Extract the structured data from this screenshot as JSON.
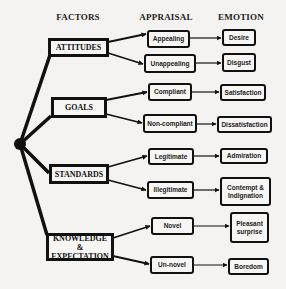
{
  "headers": {
    "factors": "FACTORS",
    "appraisal": "APPRAISAL",
    "emotion": "EMOTION"
  },
  "factors": [
    {
      "label": "ATTITUDES",
      "appraisals": [
        {
          "label": "Appealing",
          "emotion": "Desire"
        },
        {
          "label": "Unappealing",
          "emotion": "Disgust"
        }
      ]
    },
    {
      "label": "GOALS",
      "appraisals": [
        {
          "label": "Compliant",
          "emotion": "Satisfaction"
        },
        {
          "label": "Non-compliant",
          "emotion": "Dissatisfaction"
        }
      ]
    },
    {
      "label": "STANDARDS",
      "appraisals": [
        {
          "label": "Legitimate",
          "emotion": "Admiration"
        },
        {
          "label": "Illegitimate",
          "emotion": "Contempt &\nIndignation"
        }
      ]
    },
    {
      "label": "KNOWLEDGE &\nEXPECTATION",
      "appraisals": [
        {
          "label": "Novel",
          "emotion": "Pleasant\nsurprise"
        },
        {
          "label": "Un-novel",
          "emotion": "Boredom"
        }
      ]
    }
  ],
  "colors": {
    "background": "#f4f3f1",
    "stroke": "#111111"
  }
}
